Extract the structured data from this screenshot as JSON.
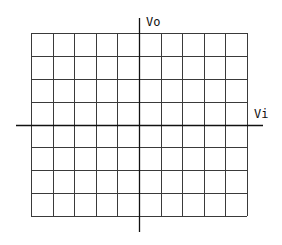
{
  "diagram": {
    "type": "oscilloscope-xy-graticule",
    "grid": {
      "columns": 10,
      "rows": 8,
      "left": 31,
      "top": 33,
      "right": 247,
      "bottom": 216,
      "line_color": "#3a3a3a"
    },
    "axes": {
      "horizontal": {
        "label": "Vi",
        "y": 125,
        "x_start": 16,
        "x_end": 263
      },
      "vertical": {
        "label": "Vo",
        "x": 139,
        "y_start": 18,
        "y_end": 232
      },
      "color": "#111111"
    }
  }
}
